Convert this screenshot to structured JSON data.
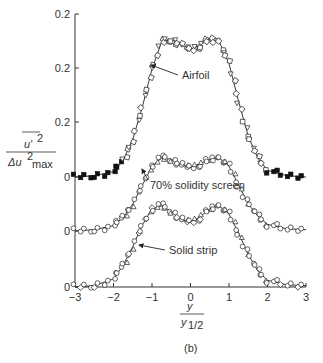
{
  "chart_data": {
    "type": "scatter",
    "title": "",
    "subtitle": "(b)",
    "xlabel": "y / y_1/2",
    "ylabel": "u'^2 / Δu^2_max",
    "xlim": [
      -3,
      3
    ],
    "x_ticks": [
      "-3",
      "-2",
      "-1",
      "0",
      "1",
      "2",
      "3"
    ],
    "y_tick_labels": [
      "0.2",
      "0.2",
      "0.2",
      "0",
      "0",
      "0"
    ],
    "grid": false,
    "legend": "annotations",
    "layout": "three vertically offset curves sharing x-axis",
    "series": [
      {
        "name": "Airfoil",
        "marker": "square/triangle (open), filled in tails",
        "x": [
          -3.0,
          -2.5,
          -2.0,
          -1.75,
          -1.5,
          -1.25,
          -1.0,
          -0.75,
          -0.5,
          -0.25,
          0.0,
          0.25,
          0.5,
          0.75,
          1.0,
          1.25,
          1.5,
          1.75,
          2.0,
          2.5,
          3.0
        ],
        "y": [
          0.0,
          0.005,
          0.02,
          0.06,
          0.14,
          0.26,
          0.4,
          0.5,
          0.51,
          0.49,
          0.47,
          0.49,
          0.51,
          0.5,
          0.42,
          0.28,
          0.15,
          0.07,
          0.025,
          0.005,
          0.0
        ]
      },
      {
        "name": "70% solidity screen",
        "marker": "circle/triangle (open)",
        "x": [
          -3.0,
          -2.5,
          -2.0,
          -1.75,
          -1.5,
          -1.25,
          -1.0,
          -0.75,
          -0.5,
          -0.25,
          0.0,
          0.25,
          0.5,
          0.75,
          1.0,
          1.25,
          1.5,
          1.75,
          2.0,
          2.5,
          3.0
        ],
        "y": [
          0.0,
          0.005,
          0.02,
          0.05,
          0.1,
          0.17,
          0.24,
          0.27,
          0.265,
          0.245,
          0.235,
          0.25,
          0.265,
          0.27,
          0.24,
          0.17,
          0.1,
          0.055,
          0.025,
          0.008,
          0.005
        ]
      },
      {
        "name": "Solid strip",
        "marker": "circle/triangle (open)",
        "x": [
          -3.0,
          -2.5,
          -2.0,
          -1.75,
          -1.5,
          -1.25,
          -1.0,
          -0.75,
          -0.5,
          -0.25,
          0.0,
          0.25,
          0.5,
          0.75,
          1.0,
          1.25,
          1.5,
          1.75,
          2.0,
          2.5,
          3.0
        ],
        "y": [
          0.0,
          0.005,
          0.03,
          0.08,
          0.15,
          0.23,
          0.29,
          0.3,
          0.28,
          0.25,
          0.24,
          0.26,
          0.29,
          0.3,
          0.27,
          0.2,
          0.12,
          0.06,
          0.025,
          0.008,
          0.005
        ]
      }
    ],
    "annotations": [
      {
        "text": "Airfoil",
        "arrow_to": "Airfoil curve left flank"
      },
      {
        "text": "70% solidity screen",
        "arrow_to": "70% solidity screen curve left flank"
      },
      {
        "text": "Solid strip",
        "arrow_to": "Solid strip curve left flank"
      }
    ]
  },
  "labels": {
    "y_num": "u'",
    "y_num_sup": "2",
    "y_den": "Δu",
    "y_den_sup": "2",
    "y_den_sub": "max",
    "x_num": "y",
    "x_den": "y",
    "x_den_sub": "1/2",
    "panel": "(b)",
    "annot_airfoil": "Airfoil",
    "annot_screen": "70% solidity screen",
    "annot_strip": "Solid strip"
  }
}
